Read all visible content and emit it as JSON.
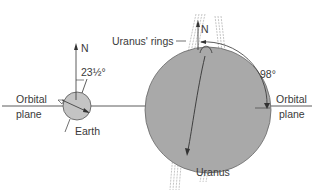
{
  "diagram": {
    "labels": {
      "earth_north": "N",
      "earth_tilt": "23½°",
      "left_orbital": "Orbital",
      "left_plane": "plane",
      "earth": "Earth",
      "uranus_rings": "Uranus' rings",
      "uranus_north": "N",
      "uranus_tilt": "98°",
      "right_orbital": "Orbital",
      "right_plane": "plane",
      "uranus": "Uranus"
    },
    "colors": {
      "planet_fill_earth": "#c4c4c4",
      "planet_fill_uranus": "#a9a9a9",
      "line": "#333333",
      "ring": "#888888"
    }
  }
}
